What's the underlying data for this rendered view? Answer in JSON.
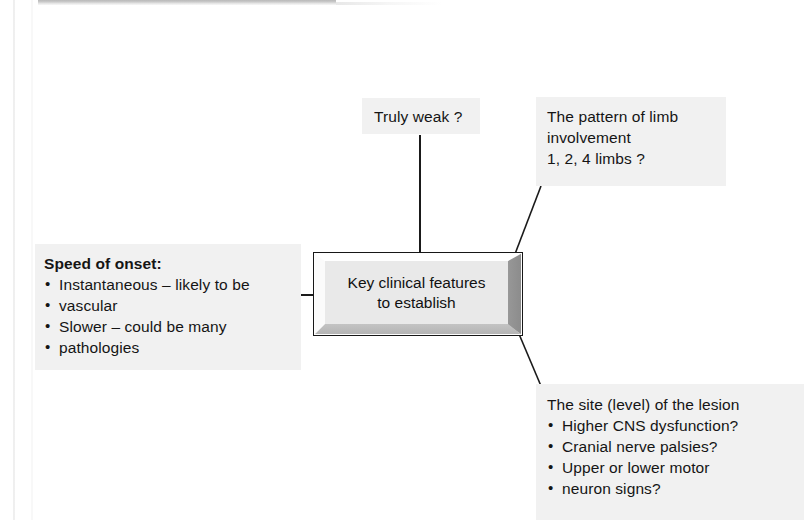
{
  "page": {
    "width": 805,
    "height": 520,
    "background": "#ffffff",
    "panel_background": "#f1f1f1",
    "ink_color": "#151515"
  },
  "central_node": {
    "line1": "Key clinical features",
    "line2": "to establish"
  },
  "branches": {
    "truly_weak": {
      "text": "Truly weak ?"
    },
    "limb_pattern": {
      "line1": "The pattern of limb",
      "line2": "involvement",
      "line3": "1, 2, 4 limbs ?"
    },
    "speed_of_onset": {
      "title": "Speed of onset:",
      "bullets": [
        {
          "line1": "Instantaneous – likely to be",
          "line2": "vascular"
        },
        {
          "line1": "Slower – could be many",
          "line2": "pathologies"
        }
      ]
    },
    "lesion_site": {
      "title": "The site (level) of the lesion",
      "bullets": [
        {
          "line1": "Higher CNS dysfunction?",
          "line2": ""
        },
        {
          "line1": "Cranial nerve palsies?",
          "line2": ""
        },
        {
          "line1": "Upper or lower motor",
          "line2": "neuron signs?"
        }
      ]
    }
  }
}
